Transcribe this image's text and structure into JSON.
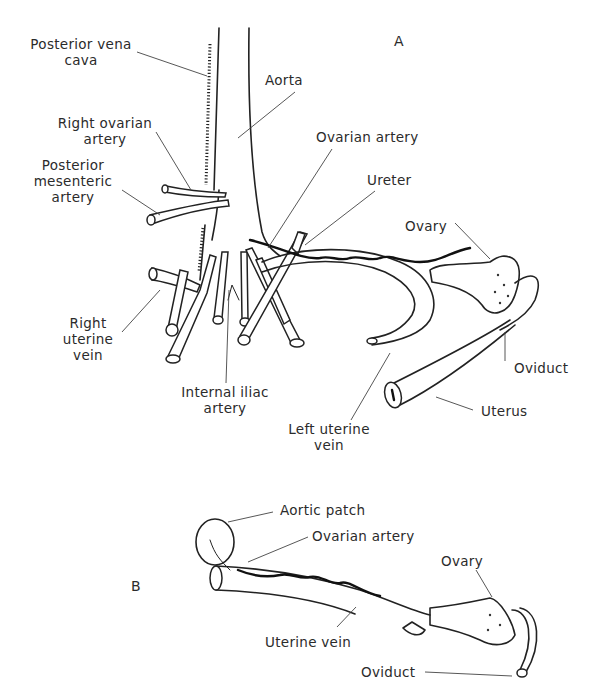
{
  "figure": {
    "type": "anatomical line drawing",
    "panels": [
      {
        "id": "A",
        "label": "A",
        "labels": {
          "posterior_vena_cava": "Posterior vena\ncava",
          "posterior_vena_cava_l1": "Posterior vena",
          "posterior_vena_cava_l2": "cava",
          "aorta": "Aorta",
          "right_ovarian_artery_l1": "Right ovarian",
          "right_ovarian_artery_l2": "artery",
          "posterior_mesenteric_artery_l1": "Posterior",
          "posterior_mesenteric_artery_l2": "mesenteric",
          "posterior_mesenteric_artery_l3": "artery",
          "ovarian_artery": "Ovarian artery",
          "ureter": "Ureter",
          "ovary": "Ovary",
          "right_uterine_vein_l1": "Right",
          "right_uterine_vein_l2": "uterine",
          "right_uterine_vein_l3": "vein",
          "internal_iliac_artery_l1": "Internal iliac",
          "internal_iliac_artery_l2": "artery",
          "oviduct": "Oviduct",
          "uterus": "Uterus",
          "left_uterine_vein_l1": "Left uterine",
          "left_uterine_vein_l2": "vein"
        }
      },
      {
        "id": "B",
        "label": "B",
        "labels": {
          "aortic_patch": "Aortic patch",
          "ovarian_artery": "Ovarian artery",
          "ovary": "Ovary",
          "uterine_vein": "Uterine vein",
          "oviduct": "Oviduct"
        }
      }
    ]
  },
  "panelA": {
    "label": "A",
    "pvc1": "Posterior vena",
    "pvc2": "cava",
    "aorta": "Aorta",
    "roa1": "Right ovarian",
    "roa2": "artery",
    "pma1": "Posterior",
    "pma2": "mesenteric",
    "pma3": "artery",
    "ovarian_artery": "Ovarian artery",
    "ureter": "Ureter",
    "ovary": "Ovary",
    "ruv1": "Right",
    "ruv2": "uterine",
    "ruv3": "vein",
    "iia1": "Internal iliac",
    "iia2": "artery",
    "oviduct": "Oviduct",
    "uterus": "Uterus",
    "luv1": "Left uterine",
    "luv2": "vein"
  },
  "panelB": {
    "label": "B",
    "aortic_patch": "Aortic patch",
    "ovarian_artery": "Ovarian artery",
    "ovary": "Ovary",
    "uterine_vein": "Uterine vein",
    "oviduct": "Oviduct"
  }
}
